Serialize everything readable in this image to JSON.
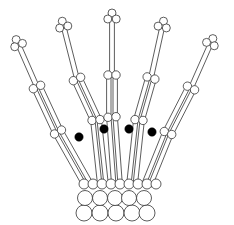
{
  "diagram": {
    "width": 234,
    "height": 225,
    "stroke_color": "#333333",
    "fill_color": "#ffffff",
    "dot_color": "#000000",
    "fingers": [
      {
        "tip": [
          19,
          46
        ],
        "j1": [
          37,
          87
        ],
        "j2": [
          58,
          132
        ],
        "base": [
          88,
          185
        ]
      },
      {
        "tip": [
          64,
          28
        ],
        "j1": [
          77,
          79
        ],
        "j2": [
          96,
          120
        ],
        "base": [
          103,
          185
        ]
      },
      {
        "tip": [
          112,
          20
        ],
        "j1": [
          112,
          75
        ],
        "j2": [
          112,
          117
        ],
        "base": [
          117,
          185
        ]
      },
      {
        "tip": [
          162,
          28
        ],
        "j1": [
          151,
          78
        ],
        "j2": [
          139,
          120
        ],
        "base": [
          132,
          185
        ]
      },
      {
        "tip": [
          210,
          45
        ],
        "j1": [
          191,
          88
        ],
        "j2": [
          168,
          133
        ],
        "base": [
          147,
          185
        ]
      }
    ],
    "black_dots": [
      [
        79,
        137
      ],
      [
        104,
        129
      ],
      [
        129,
        129
      ],
      [
        152,
        132
      ]
    ],
    "carpals": {
      "row1": {
        "y": 184,
        "r": 5,
        "xs": [
          84,
          93,
          102,
          111,
          120,
          129,
          138,
          147,
          156
        ]
      },
      "row2": {
        "y": 198,
        "r": 7.5,
        "xs": [
          84,
          99,
          114,
          128,
          143
        ]
      },
      "row3": {
        "y": 213,
        "r": 8,
        "xs": [
          84,
          100,
          116,
          132,
          147
        ]
      }
    }
  }
}
